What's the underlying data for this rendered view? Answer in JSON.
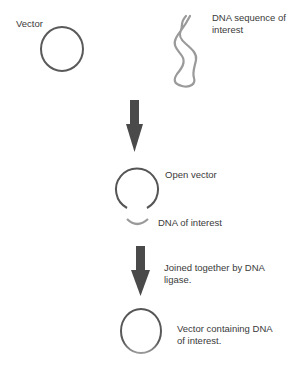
{
  "diagram": {
    "labels": {
      "vector": "Vector",
      "dna_sequence": "DNA sequence of interest",
      "dna_sequence_line1": "DNA sequence of",
      "dna_sequence_line2": "interest",
      "open_vector": "Open vector",
      "dna_of_interest": "DNA of interest",
      "ligase_line1": "Joined together by DNA",
      "ligase_line2": "ligase.",
      "result_line1": "Vector containing DNA",
      "result_line2": "of interest."
    },
    "colors": {
      "vector": "#555555",
      "dna": "#9a9a9a",
      "arrow": "#4a4a4a",
      "text": "#3a3a3a"
    },
    "steps": [
      {
        "name": "vector-and-dna",
        "elements": [
          "Vector",
          "DNA sequence of interest"
        ]
      },
      {
        "name": "open-vector",
        "elements": [
          "Open vector",
          "DNA of interest"
        ]
      },
      {
        "name": "ligation",
        "elements": [
          "Joined together by DNA ligase.",
          "Vector containing DNA of interest."
        ]
      }
    ]
  }
}
